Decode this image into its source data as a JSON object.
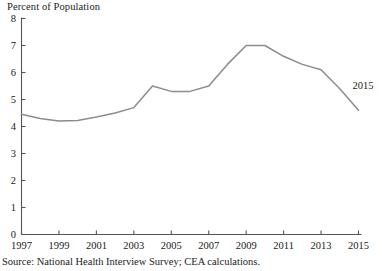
{
  "chart_data": {
    "type": "line",
    "title": "",
    "ylabel": "Percent of Population",
    "xlabel": "",
    "ylim": [
      0,
      8
    ],
    "xlim": [
      1997,
      2015
    ],
    "grid": false,
    "legend": false,
    "ytick_labels": [
      "8",
      "7",
      "6",
      "5",
      "4",
      "3",
      "2",
      "1",
      "0"
    ],
    "ytick_values": [
      8,
      7,
      6,
      5,
      4,
      3,
      2,
      1,
      0
    ],
    "xtick_labels": [
      "1997",
      "1999",
      "2001",
      "2003",
      "2005",
      "2007",
      "2009",
      "2011",
      "2013",
      "2015"
    ],
    "xtick_values": [
      1997,
      1999,
      2001,
      2003,
      2005,
      2007,
      2009,
      2011,
      2013,
      2015
    ],
    "x": [
      1997,
      1998,
      1999,
      2000,
      2001,
      2002,
      2003,
      2004,
      2005,
      2006,
      2007,
      2008,
      2009,
      2010,
      2011,
      2012,
      2013,
      2014,
      2015
    ],
    "values": [
      4.45,
      4.3,
      4.2,
      4.22,
      4.35,
      4.5,
      4.7,
      5.5,
      5.3,
      5.3,
      5.5,
      6.3,
      7.0,
      7.0,
      6.6,
      6.3,
      6.1,
      5.4,
      4.6
    ],
    "series": [
      {
        "name": "Percent of Population",
        "color": "#8c8c8c",
        "values": [
          4.45,
          4.3,
          4.2,
          4.22,
          4.35,
          4.5,
          4.7,
          5.5,
          5.3,
          5.3,
          5.5,
          6.3,
          7.0,
          7.0,
          6.6,
          6.3,
          6.1,
          5.4,
          4.6
        ]
      }
    ],
    "annotations": [
      {
        "text": "2015",
        "x": 2015,
        "y": 5.5
      }
    ],
    "source_note": "Source: National Health Interview Survey; CEA calculations.",
    "axis_color": "#555555"
  }
}
